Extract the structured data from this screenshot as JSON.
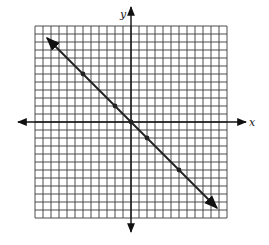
{
  "chart_data": {
    "type": "line",
    "title": "",
    "xlabel": "x",
    "ylabel": "y",
    "xlim": [
      -12,
      12
    ],
    "ylim": [
      -12,
      12
    ],
    "grid": true,
    "grid_step": 1,
    "legend": null,
    "equation": "y = -x",
    "series": [
      {
        "name": "line",
        "points": [
          [
            -6,
            6
          ],
          [
            -2,
            2
          ],
          [
            0,
            0
          ],
          [
            2,
            -2
          ],
          [
            6,
            -6
          ]
        ],
        "extends_with_arrows": true,
        "arrow_ends": [
          [
            -10.5,
            10.5
          ],
          [
            10.75,
            -10.75
          ]
        ]
      }
    ]
  },
  "colors": {
    "grid": "#3a3a3a",
    "axis": "#111111",
    "line": "#222222",
    "background": "#ffffff"
  }
}
